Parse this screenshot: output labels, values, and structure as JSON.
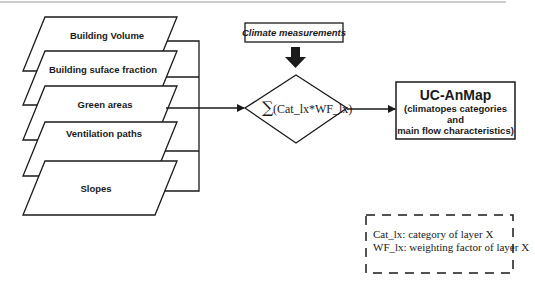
{
  "diagram": {
    "layers": [
      {
        "label": "Building Volume"
      },
      {
        "label": "Building suface fraction"
      },
      {
        "label": "Green areas"
      },
      {
        "label": "Ventilation paths"
      },
      {
        "label": "Slopes"
      }
    ],
    "climate_input": {
      "label": "Climate measurements"
    },
    "operation": {
      "sigma": "∑",
      "formula": "(Cat_lx*WF_lx)"
    },
    "output": {
      "title": "UC-AnMap",
      "subtitle_line1": "(climatopes categories",
      "subtitle_line2": "and",
      "subtitle_line3": "main flow characteristics)"
    },
    "legend": {
      "line1": "Cat_lx: category of layer X",
      "line2": "WF_lx: weighting factor of layer X"
    },
    "colors": {
      "stroke": "#1a1a1a",
      "rule": "#9a9a9a",
      "background": "#ffffff"
    }
  }
}
